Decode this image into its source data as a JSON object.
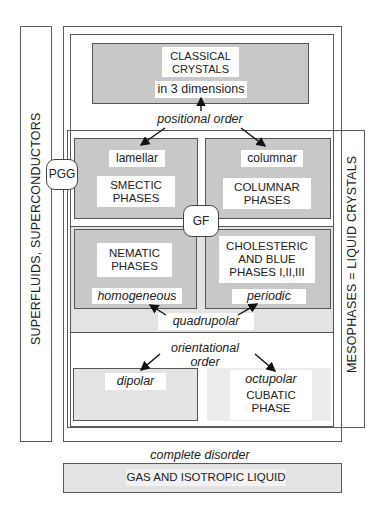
{
  "diagram": {
    "left_bar": {
      "label": "SUPERFLUIDS, SUPERCONDUCTORS"
    },
    "right_bar": {
      "label": "MESOPHASES = LIQUID CRYSTALS"
    },
    "crystals": {
      "title_line1": "CLASSICAL",
      "title_line2": "CRYSTALS",
      "subtitle": "in 3 dimensions"
    },
    "positional_order": "positional order",
    "smectic": {
      "tag": "lamellar",
      "title_line1": "SMECTIC",
      "title_line2": "PHASES"
    },
    "columnar": {
      "tag": "columnar",
      "title_line1": "COLUMNAR",
      "title_line2": "PHASES"
    },
    "pgg_badge": "PGG",
    "gf_badge": "GF",
    "nematic": {
      "title_line1": "NEMATIC",
      "title_line2": "PHASES",
      "tag": "homogeneous"
    },
    "cholesteric": {
      "title_line1": "CHOLESTERIC",
      "title_line2": "AND BLUE",
      "title_line3": "PHASES I,II,III",
      "tag": "periodic"
    },
    "quadrupolar": "quadrupolar",
    "orientational_order_line1": "orientational",
    "orientational_order_line2": "order",
    "dipolar": {
      "tag": "dipolar"
    },
    "octupolar": {
      "tag": "octupolar",
      "title_line1": "CUBATIC",
      "title_line2": "PHASE"
    },
    "complete_disorder": "complete disorder",
    "gas": {
      "label": "GAS AND ISOTROPIC LIQUID"
    }
  },
  "colors": {
    "dark_fill": "#c8c8c8",
    "medium_fill": "#e3e3e3",
    "light_fill": "#ececec",
    "line": "#555555"
  }
}
